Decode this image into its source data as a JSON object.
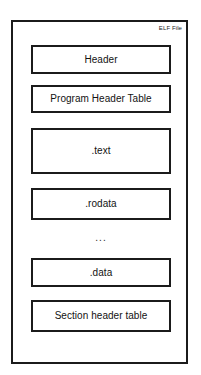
{
  "diagram": {
    "title": "ELF File",
    "container_label": "ELF File",
    "ellipsis": "...",
    "sections": [
      {
        "label": "Header"
      },
      {
        "label": "Program Header Table"
      },
      {
        "label": ".text"
      },
      {
        "label": ".rodata"
      },
      {
        "label": ".data"
      },
      {
        "label": "Section header table"
      }
    ],
    "colors": {
      "background": "#ffffff",
      "stroke": "#1b1b1b",
      "text": "#121212",
      "box_fill": "#ffffff"
    }
  }
}
